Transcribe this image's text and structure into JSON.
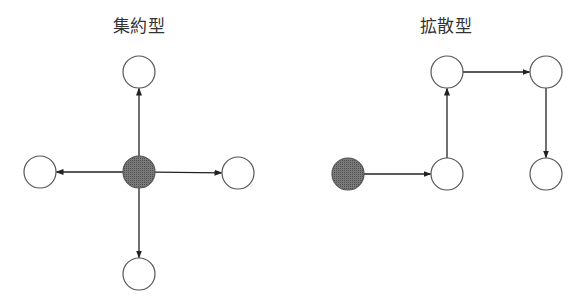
{
  "diagrams": [
    {
      "title": "集約型",
      "title_x": 139,
      "nodes": [
        {
          "id": "top",
          "x": 139,
          "y": 72,
          "filled": false
        },
        {
          "id": "center",
          "x": 139,
          "y": 172,
          "filled": true
        },
        {
          "id": "left",
          "x": 40,
          "y": 172,
          "filled": false
        },
        {
          "id": "right",
          "x": 238,
          "y": 173,
          "filled": false
        },
        {
          "id": "bottom",
          "x": 139,
          "y": 274,
          "filled": false
        }
      ],
      "edges": [
        {
          "from": "center",
          "to": "top"
        },
        {
          "from": "center",
          "to": "left"
        },
        {
          "from": "center",
          "to": "right"
        },
        {
          "from": "center",
          "to": "bottom"
        }
      ]
    },
    {
      "title": "拡散型",
      "title_x": 446,
      "nodes": [
        {
          "id": "start",
          "x": 348,
          "y": 174,
          "filled": true
        },
        {
          "id": "n1",
          "x": 447,
          "y": 174,
          "filled": false
        },
        {
          "id": "n2",
          "x": 447,
          "y": 72,
          "filled": false
        },
        {
          "id": "n3",
          "x": 546,
          "y": 72,
          "filled": false
        },
        {
          "id": "n4",
          "x": 546,
          "y": 174,
          "filled": false
        }
      ],
      "edges": [
        {
          "from": "start",
          "to": "n1"
        },
        {
          "from": "n1",
          "to": "n2"
        },
        {
          "from": "n2",
          "to": "n3"
        },
        {
          "from": "n3",
          "to": "n4"
        }
      ]
    }
  ],
  "style": {
    "node_radius": 16,
    "node_stroke": "#555555",
    "filled_color": "#6e6e6e",
    "edge_color": "#222222"
  }
}
